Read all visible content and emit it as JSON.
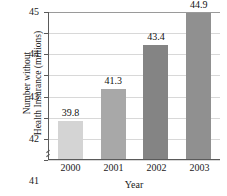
{
  "chart_data": {
    "type": "bar",
    "title": "Number without Health Insurance",
    "title_visible": false,
    "categories": [
      "2000",
      "2001",
      "2002",
      "2003"
    ],
    "values": [
      39.8,
      41.3,
      43.4,
      44.9
    ],
    "value_labels": [
      "39.8",
      "41.3",
      "43.4",
      "44.9"
    ],
    "xlabel": "Year",
    "ylabel_line1": "Number without",
    "ylabel_line2": "Health Insurance (millions)",
    "ylim": [
      38,
      45
    ],
    "yticks": [
      "45",
      "44",
      "43",
      "42",
      "41",
      "40",
      "39",
      "38"
    ],
    "ytick_values": [
      45,
      44,
      43,
      42,
      41,
      40,
      39,
      38
    ],
    "grid": true,
    "legend": false,
    "axis_break": true,
    "bar_colors": [
      "#d4d4d4",
      "#a8a8a8",
      "#848484",
      "#909090"
    ],
    "grid_color": "#d8d8d8",
    "axis_color": "#5a5a5a"
  }
}
